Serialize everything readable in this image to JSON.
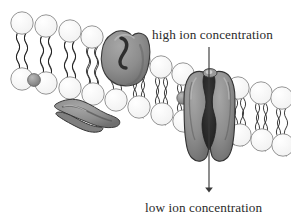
{
  "figure": {
    "labels": {
      "high": "high ion concentration",
      "low": "low ion concentration"
    },
    "arrow": {
      "name": "ion-flow-arrow",
      "direction": "downward",
      "x": 209,
      "y_start": 47,
      "y_end": 193
    },
    "colors": {
      "background": "#ffffff",
      "text": "#2a2a2a",
      "head_fill": "#fdfdfd",
      "head_stroke": "#8a8a8a",
      "tail_stroke": "#1a1a1a",
      "protein_fill": "#8e8e8e",
      "protein_stroke": "#3a3a3a",
      "protein_shadow": "#6e6e6e",
      "pore_fill": "#2b2b2b",
      "arrow_stroke": "#3a3a3a"
    },
    "structures": [
      {
        "name": "lipid-bilayer",
        "label": "phospholipid bilayer",
        "leaflets": 2
      },
      {
        "name": "integral-protein",
        "label": "integral membrane protein"
      },
      {
        "name": "peripheral-protein",
        "label": "peripheral membrane protein"
      },
      {
        "name": "ion-channel-protein",
        "label": "ion channel protein"
      },
      {
        "name": "ion-pore",
        "label": "channel pore"
      }
    ],
    "geometry": {
      "membrane_slope_note": "membrane descends left to right",
      "upper_heads": [
        {
          "x": 22,
          "y": 23
        },
        {
          "x": 46,
          "y": 26
        },
        {
          "x": 70,
          "y": 31
        },
        {
          "x": 92,
          "y": 37
        },
        {
          "x": 139,
          "y": 60
        },
        {
          "x": 161,
          "y": 67
        },
        {
          "x": 183,
          "y": 74
        },
        {
          "x": 238,
          "y": 88
        },
        {
          "x": 261,
          "y": 93
        },
        {
          "x": 282,
          "y": 98
        }
      ],
      "lower_heads": [
        {
          "x": 22,
          "y": 79
        },
        {
          "x": 46,
          "y": 83
        },
        {
          "x": 70,
          "y": 88
        },
        {
          "x": 93,
          "y": 94
        },
        {
          "x": 116,
          "y": 100
        },
        {
          "x": 139,
          "y": 107
        },
        {
          "x": 162,
          "y": 114
        },
        {
          "x": 184,
          "y": 121
        },
        {
          "x": 240,
          "y": 135
        },
        {
          "x": 262,
          "y": 140
        },
        {
          "x": 283,
          "y": 145
        }
      ]
    }
  }
}
